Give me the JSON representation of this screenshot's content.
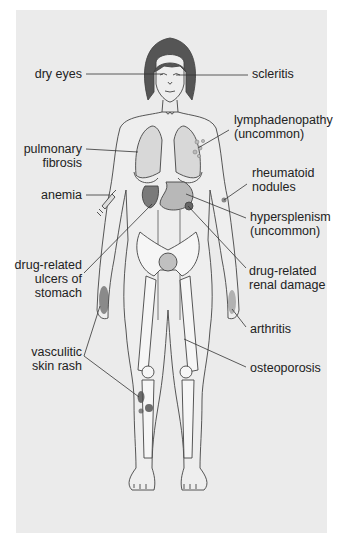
{
  "diagram": {
    "type": "anatomical-annotation",
    "colors": {
      "panel_background": "#ebebeb",
      "skin_fill": "#eeeeee",
      "outline": "#444444",
      "hair": "#555555",
      "organ_fill": "#c8c8c8",
      "bone_fill": "#f6f6f6",
      "lesion_dark": "#5a5a5a",
      "leader_line": "#333333",
      "label_text": "#222222"
    },
    "labels_left": [
      {
        "id": "dry-eyes",
        "lines": [
          "dry eyes"
        ]
      },
      {
        "id": "pulmonary-fibrosis",
        "lines": [
          "pulmonary",
          "fibrosis"
        ]
      },
      {
        "id": "anemia",
        "lines": [
          "anemia"
        ]
      },
      {
        "id": "drug-related-ulcers",
        "lines": [
          "drug-related",
          "ulcers of",
          "stomach"
        ]
      },
      {
        "id": "vasculitic-skin-rash",
        "lines": [
          "vasculitic",
          "skin rash"
        ]
      }
    ],
    "labels_right": [
      {
        "id": "scleritis",
        "lines": [
          "scleritis"
        ]
      },
      {
        "id": "lymphadenopathy",
        "lines": [
          "lymphadenopathy",
          "(uncommon)"
        ]
      },
      {
        "id": "rheumatoid-nodules",
        "lines": [
          "rheumatoid",
          "nodules"
        ]
      },
      {
        "id": "hypersplenism",
        "lines": [
          "hypersplenism",
          "(uncommon)"
        ]
      },
      {
        "id": "drug-related-renal-damage",
        "lines": [
          "drug-related",
          "renal damage"
        ]
      },
      {
        "id": "arthritis",
        "lines": [
          "arthritis"
        ]
      },
      {
        "id": "osteoporosis",
        "lines": [
          "osteoporosis"
        ]
      }
    ]
  }
}
